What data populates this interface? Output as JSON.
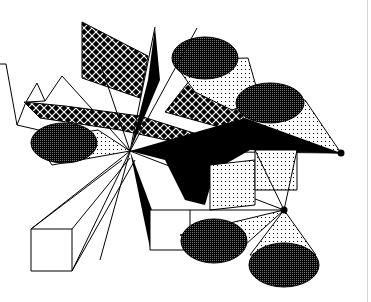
{
  "artwork": {
    "description": "Monochrome bitmap drawing of geometric shapes in perspective: wireframe boxes, patterned cylinders, cross-hatched polygons and black wedges radiating from vanishing points",
    "colors": {
      "background": "#ffffff",
      "ink": "#000000",
      "dark_fill": "#3a3a3a",
      "edge_line": "#d8d8d8"
    },
    "vanishing_points": [
      {
        "name": "center",
        "x": 130,
        "y": 151
      },
      {
        "name": "lower-right",
        "x": 284,
        "y": 210
      },
      {
        "name": "right",
        "x": 341,
        "y": 153
      }
    ],
    "patterns": [
      "crosshatch",
      "dots",
      "dark-halftone",
      "solid-black"
    ]
  }
}
